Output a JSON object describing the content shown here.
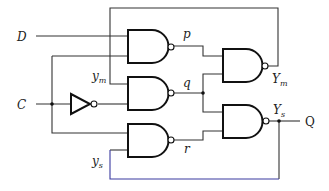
{
  "diagram": {
    "type": "gated D latch (master-slave style NAND logic)",
    "inputs": {
      "d": "D",
      "c": "C"
    },
    "output": "Q",
    "nodes": {
      "p": "p",
      "q": "q",
      "r": "r",
      "ym": {
        "base": "y",
        "sub": "m"
      },
      "ys": {
        "base": "y",
        "sub": "s"
      },
      "Ym": {
        "base": "Y",
        "sub": "m"
      },
      "Ys": {
        "base": "Y",
        "sub": "s"
      }
    },
    "gates": [
      {
        "id": "nand-p",
        "type": "NAND",
        "inputs": [
          "D",
          "C"
        ],
        "output": "p"
      },
      {
        "id": "nand-q",
        "type": "NAND",
        "inputs": [
          "ym",
          "C'"
        ],
        "output": "q"
      },
      {
        "id": "nand-r",
        "type": "NAND",
        "inputs": [
          "C",
          "ys"
        ],
        "output": "r"
      },
      {
        "id": "nand-Ym",
        "type": "NAND",
        "inputs": [
          "p",
          "q"
        ],
        "output": "Ym"
      },
      {
        "id": "nand-Ys",
        "type": "NAND",
        "inputs": [
          "q",
          "r"
        ],
        "output": "Ys"
      },
      {
        "id": "inverter",
        "type": "NOT",
        "inputs": [
          "C"
        ],
        "output": "C'"
      }
    ],
    "colors": {
      "wire": "#333333",
      "gate": "#111111",
      "bottom_wire_accent": "#3a3aa0"
    }
  }
}
